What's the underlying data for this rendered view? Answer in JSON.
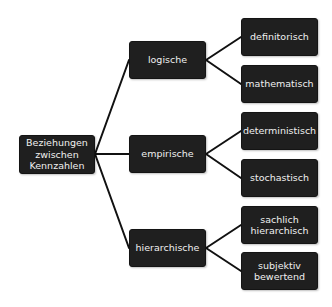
{
  "diagram": {
    "type": "tree",
    "orientation": "left-to-right",
    "colors": {
      "node_fill": "#1f1f1f",
      "node_text": "#f0f0f0",
      "connector": "#111111",
      "background": "#ffffff"
    },
    "root": {
      "label": "Beziehungen\nzwischen\nKennzahlen"
    },
    "branches": [
      {
        "label": "logische",
        "children": [
          {
            "label": "definitorisch"
          },
          {
            "label": "mathematisch"
          }
        ]
      },
      {
        "label": "empirische",
        "children": [
          {
            "label": "deterministisch"
          },
          {
            "label": "stochastisch"
          }
        ]
      },
      {
        "label": "hierarchische",
        "children": [
          {
            "label": "sachlich\nhierarchisch"
          },
          {
            "label": "subjektiv\nbewertend"
          }
        ]
      }
    ]
  }
}
